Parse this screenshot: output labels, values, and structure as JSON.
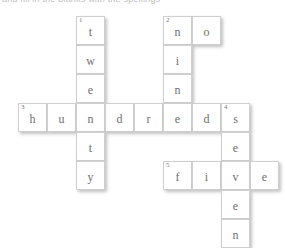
{
  "page": {
    "title_clipped": "and fill in the blanks with the spellings",
    "background_color": "#ffffff",
    "cell_background": "#ffffff",
    "cell_border_color": "#cfcfcf",
    "letter_color": "#6f6f6f",
    "number_color": "#7a7a7a"
  },
  "crossword": {
    "cell_size": 29,
    "origin": {
      "x": 18,
      "y": 16
    },
    "clues_numbers": [
      "1",
      "2",
      "3",
      "4",
      "5"
    ],
    "entries": [
      {
        "number": "1",
        "direction": "down",
        "answer": "twenty",
        "length": 6
      },
      {
        "number": "2",
        "direction": "down",
        "answer": "nine",
        "length": 4
      },
      {
        "number": "2",
        "direction": "across",
        "answer": "no",
        "length": 2
      },
      {
        "number": "3",
        "direction": "across",
        "answer": "hundreds",
        "length": 8
      },
      {
        "number": "4",
        "direction": "down",
        "answer": "seven",
        "length": 5
      },
      {
        "number": "5",
        "direction": "across",
        "answer": "five",
        "length": 4
      }
    ],
    "cells": [
      {
        "name": "cell-r0c2",
        "col": 2,
        "row": 0,
        "letter": "t",
        "number": "1"
      },
      {
        "name": "cell-r0c5",
        "col": 5,
        "row": 0,
        "letter": "n",
        "number": "2"
      },
      {
        "name": "cell-r0c6",
        "col": 6,
        "row": 0,
        "letter": "o",
        "number": ""
      },
      {
        "name": "cell-r1c2",
        "col": 2,
        "row": 1,
        "letter": "w",
        "number": ""
      },
      {
        "name": "cell-r1c5",
        "col": 5,
        "row": 1,
        "letter": "i",
        "number": ""
      },
      {
        "name": "cell-r2c2",
        "col": 2,
        "row": 2,
        "letter": "e",
        "number": ""
      },
      {
        "name": "cell-r2c5",
        "col": 5,
        "row": 2,
        "letter": "n",
        "number": ""
      },
      {
        "name": "cell-r3c0",
        "col": 0,
        "row": 3,
        "letter": "h",
        "number": "3"
      },
      {
        "name": "cell-r3c1",
        "col": 1,
        "row": 3,
        "letter": "u",
        "number": ""
      },
      {
        "name": "cell-r3c2",
        "col": 2,
        "row": 3,
        "letter": "n",
        "number": ""
      },
      {
        "name": "cell-r3c3",
        "col": 3,
        "row": 3,
        "letter": "d",
        "number": ""
      },
      {
        "name": "cell-r3c4",
        "col": 4,
        "row": 3,
        "letter": "r",
        "number": ""
      },
      {
        "name": "cell-r3c5",
        "col": 5,
        "row": 3,
        "letter": "e",
        "number": ""
      },
      {
        "name": "cell-r3c6",
        "col": 6,
        "row": 3,
        "letter": "d",
        "number": ""
      },
      {
        "name": "cell-r3c7",
        "col": 7,
        "row": 3,
        "letter": "s",
        "number": "4"
      },
      {
        "name": "cell-r4c2",
        "col": 2,
        "row": 4,
        "letter": "t",
        "number": ""
      },
      {
        "name": "cell-r4c7",
        "col": 7,
        "row": 4,
        "letter": "e",
        "number": ""
      },
      {
        "name": "cell-r5c2",
        "col": 2,
        "row": 5,
        "letter": "y",
        "number": ""
      },
      {
        "name": "cell-r5c5",
        "col": 5,
        "row": 5,
        "letter": "f",
        "number": "5"
      },
      {
        "name": "cell-r5c6",
        "col": 6,
        "row": 5,
        "letter": "i",
        "number": ""
      },
      {
        "name": "cell-r5c7",
        "col": 7,
        "row": 5,
        "letter": "v",
        "number": ""
      },
      {
        "name": "cell-r5c8",
        "col": 8,
        "row": 5,
        "letter": "e",
        "number": ""
      },
      {
        "name": "cell-r6c7",
        "col": 7,
        "row": 6,
        "letter": "e",
        "number": ""
      },
      {
        "name": "cell-r7c7",
        "col": 7,
        "row": 7,
        "letter": "n",
        "number": ""
      }
    ]
  }
}
